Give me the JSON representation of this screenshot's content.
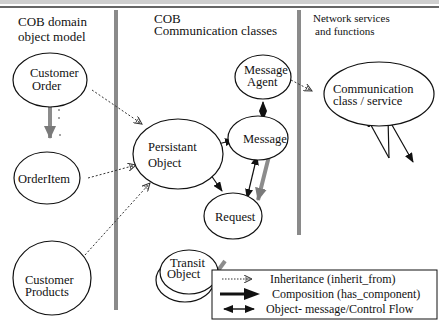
{
  "top_banner": {
    "text": ""
  },
  "columns": [
    {
      "id": "domain",
      "header_lines": [
        "COB domain",
        "object model"
      ]
    },
    {
      "id": "communication",
      "header_lines": [
        "COB",
        "Communication classes"
      ]
    },
    {
      "id": "network",
      "header_lines": [
        "Network services",
        "and functions"
      ]
    }
  ],
  "nodes": {
    "customer_order": {
      "lines": [
        "Customer",
        "Order"
      ]
    },
    "order_item": {
      "lines": [
        "OrderItem"
      ]
    },
    "customer_products": {
      "lines": [
        "Customer",
        "Products"
      ]
    },
    "persistant_object": {
      "lines": [
        "Persistant",
        "Object"
      ]
    },
    "message_agent": {
      "lines": [
        "Message",
        "Agent"
      ]
    },
    "message": {
      "lines": [
        "Message"
      ]
    },
    "request": {
      "lines": [
        "Request"
      ]
    },
    "transit_object": {
      "lines": [
        "Transit",
        "Object"
      ]
    },
    "communication_service": {
      "lines": [
        "Communication",
        "class / service"
      ]
    }
  },
  "legend": {
    "items": [
      {
        "type": "inheritance",
        "label": "Inheritance (inherit_from)"
      },
      {
        "type": "composition",
        "label": "Composition (has_component)"
      },
      {
        "type": "message_flow",
        "label": "Object- message/Control Flow"
      }
    ]
  },
  "colors": {
    "ink": "#111111",
    "divider": "#8a8a8a",
    "composition": "#8c8c8c"
  }
}
